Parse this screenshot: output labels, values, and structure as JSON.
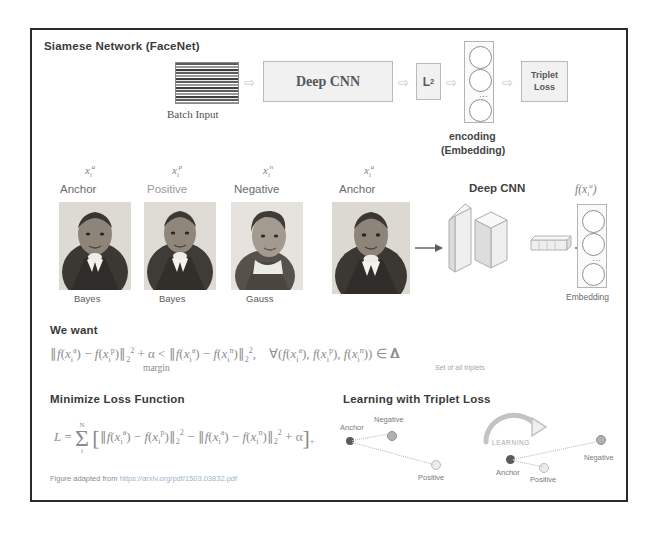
{
  "figure": {
    "title": "Siamese Network (FaceNet)",
    "footer_prefix": "Figure adapted from ",
    "footer_url": "https://arxiv.org/pdf/1503.03832.pdf"
  },
  "pipeline": {
    "input_label": "Batch Input",
    "cnn_label": "Deep CNN",
    "l2_label": "L",
    "l2_sub": "2",
    "loss_label_line1": "Triplet",
    "loss_label_line2": "Loss",
    "encoding_line1": "encoding",
    "encoding_line2": "(Embedding)",
    "arrow_glyph": "⇨"
  },
  "triplet_inputs": [
    {
      "var": "x",
      "sub": "i",
      "sup": "a",
      "role": "Anchor",
      "person": "Bayes"
    },
    {
      "var": "x",
      "sub": "i",
      "sup": "p",
      "role": "Positive",
      "person": "Bayes"
    },
    {
      "var": "x",
      "sub": "i",
      "sup": "n",
      "role": "Negative",
      "person": "Gauss"
    }
  ],
  "encoder_row": {
    "input_var": "x",
    "input_sub": "i",
    "input_sup": "a",
    "input_role": "Anchor",
    "cnn_label": "Deep CNN",
    "output_label": "f(x",
    "output_sub": "i",
    "output_sup": "a",
    "output_tail": ")",
    "embedding_label": "Embedding"
  },
  "we_want": {
    "heading": "We want",
    "margin_label": "margin",
    "triplets_label": "Set of all triplets",
    "equation_plain": "||f(x_i^a) - f(x_i^p)||_2^2 + α < ||f(x_i^a) - f(x_i^n)||_2^2 ,   ∀ ( f(x_i^a), f(x_i^p), f(x_i^n) ) ∈ T"
  },
  "loss": {
    "heading": "Minimize Loss Function",
    "equation_plain": "L = Σ_i^N [ ||f(x_i^a) - f(x_i^p)||_2^2 - ||f(x_i^a) - f(x_i^n)||_2^2 + α ]_+",
    "sum_upper": "N",
    "sum_lower": "i"
  },
  "learning": {
    "heading": "Learning with Triplet Loss",
    "arrow_label": "LEARNING",
    "before": {
      "anchor": "Anchor",
      "negative": "Negative",
      "positive": "Positive"
    },
    "after": {
      "anchor": "Anchor",
      "negative": "Negative",
      "positive": "Positive"
    }
  },
  "colors": {
    "frame": "#2b2b2b",
    "box_fill": "#f1f1f1",
    "box_stroke": "#b9b9b9",
    "text": "#5f5f5f",
    "heading": "#3a3a3a",
    "equation": "#8c8c8c",
    "node_dark": "#5a5a5a",
    "node_mid": "#b0b0b0",
    "node_light": "#ececec"
  }
}
